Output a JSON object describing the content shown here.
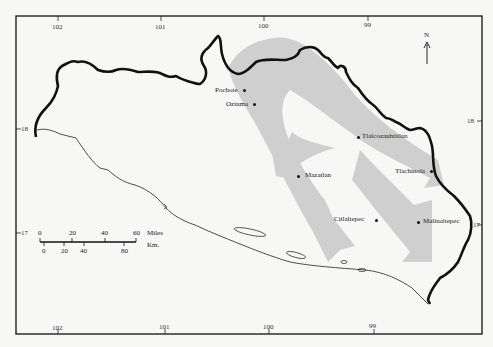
{
  "map": {
    "title": "",
    "colors": {
      "border": "#111111",
      "flow_arrows": "#cfcfcf",
      "background": "#f7f7f5"
    },
    "longitude_ticks_top": [
      "102",
      "101",
      "100",
      "99"
    ],
    "longitude_ticks_bottom": [
      "102",
      "101",
      "100",
      "99"
    ],
    "latitude_ticks_left": [
      "18",
      "17"
    ],
    "latitude_ticks_right": [
      "18",
      "17"
    ],
    "north_arrow": {
      "label": "N"
    },
    "towns": [
      {
        "name": "Pochote"
      },
      {
        "name": "Oztuma"
      },
      {
        "name": "Tlalcozauhtitlan"
      },
      {
        "name": "Mazatlan"
      },
      {
        "name": "Tlachinola"
      },
      {
        "name": "Citlaltepec"
      },
      {
        "name": "Malinaltepec"
      }
    ],
    "scale_bar": {
      "miles_label": "Miles",
      "km_label": "Km.",
      "miles_ticks": [
        "0",
        "20",
        "40",
        "60"
      ],
      "km_ticks": [
        "0",
        "20",
        "40",
        "80"
      ]
    }
  }
}
